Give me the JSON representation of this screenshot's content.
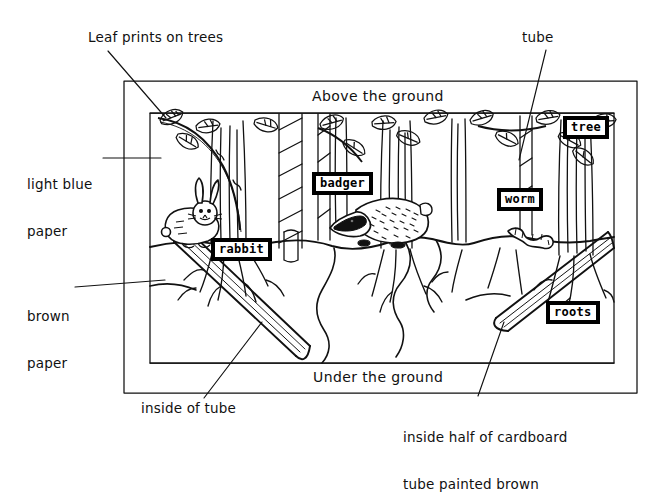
{
  "frame": {
    "band_top_label": "Above the ground",
    "band_bottom_label": "Under the ground"
  },
  "tags": [
    {
      "id": "rabbit",
      "label": "rabbit"
    },
    {
      "id": "badger",
      "label": "badger"
    },
    {
      "id": "worm",
      "label": "worm"
    },
    {
      "id": "tree",
      "label": "tree"
    },
    {
      "id": "roots",
      "label": "roots"
    }
  ],
  "annotations": [
    {
      "id": "leaf-prints",
      "label": "Leaf prints on trees"
    },
    {
      "id": "light-blue",
      "line1": "light blue",
      "line2": "paper"
    },
    {
      "id": "brown-paper",
      "line1": "brown",
      "line2": "paper"
    },
    {
      "id": "tube",
      "label": "tube"
    },
    {
      "id": "inside-tube",
      "label": "inside of tube"
    },
    {
      "id": "inside-half",
      "line1": "inside half of cardboard",
      "line2": "tube painted brown"
    }
  ],
  "colors": {
    "ink": "#000000",
    "paper": "#ffffff"
  }
}
